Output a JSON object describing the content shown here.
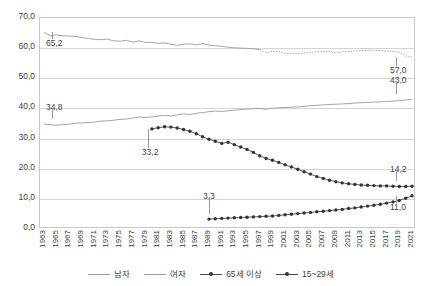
{
  "chart_data": {
    "type": "line",
    "title": "",
    "xlabel": "",
    "ylabel": "",
    "ylim": [
      0.0,
      70.0
    ],
    "ytick_labels": [
      "70,0",
      "60,0",
      "50,0",
      "40,0",
      "30,0",
      "20,0",
      "10,0",
      "0,0"
    ],
    "ytick_values": [
      70.0,
      60.0,
      50.0,
      40.0,
      30.0,
      20.0,
      10.0,
      0.0
    ],
    "grid": true,
    "legend_position": "bottom",
    "x": [
      1963,
      1964,
      1965,
      1966,
      1967,
      1968,
      1969,
      1970,
      1971,
      1972,
      1973,
      1974,
      1975,
      1976,
      1977,
      1978,
      1979,
      1980,
      1981,
      1982,
      1983,
      1984,
      1985,
      1986,
      1987,
      1988,
      1989,
      1990,
      1991,
      1992,
      1993,
      1994,
      1995,
      1996,
      1997,
      1998,
      1999,
      2000,
      2001,
      2002,
      2003,
      2004,
      2005,
      2006,
      2007,
      2008,
      2009,
      2010,
      2011,
      2012,
      2013,
      2014,
      2015,
      2016,
      2017,
      2018,
      2019,
      2020,
      2021
    ],
    "xtick_labels": [
      "1963",
      "1965",
      "1967",
      "1969",
      "1971",
      "1973",
      "1975",
      "1977",
      "1979",
      "1981",
      "1983",
      "1985",
      "1987",
      "1989",
      "1991",
      "1993",
      "1995",
      "1997",
      "1999",
      "2001",
      "2003",
      "2005",
      "2007",
      "2009",
      "2011",
      "2013",
      "2015",
      "2017",
      "2019",
      "2021"
    ],
    "series": [
      {
        "name": "남자",
        "style": "line-solid-then-dotted",
        "color": "#9a9a9a",
        "values": [
          65.2,
          64.2,
          64.4,
          64.1,
          64.0,
          63.9,
          63.5,
          63.2,
          62.9,
          62.8,
          63.0,
          62.4,
          62.3,
          62.6,
          62.0,
          62.4,
          61.9,
          61.9,
          61.6,
          61.7,
          61.3,
          60.9,
          61.3,
          61.4,
          61.1,
          61.5,
          61.0,
          60.8,
          60.6,
          60.3,
          60.1,
          60.0,
          59.9,
          59.8,
          59.5,
          58.6,
          58.9,
          58.8,
          58.3,
          58.3,
          58.2,
          58.4,
          58.6,
          58.8,
          59.0,
          58.9,
          58.3,
          58.8,
          58.9,
          59.1,
          59.2,
          59.3,
          59.3,
          59.2,
          59.0,
          58.9,
          58.7,
          57.4,
          57.0
        ],
        "label_points": [
          {
            "x": 1963,
            "value": "65,2"
          },
          {
            "x": 2021,
            "value": "57,0"
          }
        ]
      },
      {
        "name": "여자",
        "style": "line-solid",
        "color": "#9a9a9a",
        "values": [
          34.8,
          34.6,
          34.4,
          34.6,
          34.8,
          35.1,
          35.2,
          35.3,
          35.5,
          35.8,
          35.9,
          36.1,
          36.4,
          36.5,
          36.8,
          37.2,
          37.0,
          37.2,
          37.5,
          37.7,
          37.5,
          37.9,
          38.2,
          38.0,
          38.4,
          38.6,
          38.9,
          39.1,
          39.0,
          39.2,
          39.4,
          39.6,
          39.8,
          39.9,
          40.0,
          39.7,
          40.1,
          40.2,
          40.3,
          40.4,
          40.5,
          40.7,
          40.9,
          41.0,
          41.2,
          41.3,
          41.4,
          41.5,
          41.6,
          41.8,
          41.9,
          42.0,
          42.1,
          42.2,
          42.3,
          42.4,
          42.6,
          42.8,
          43.0
        ],
        "label_points": [
          {
            "x": 1963,
            "value": "34,8"
          },
          {
            "x": 2021,
            "value": "43,0"
          }
        ]
      },
      {
        "name": "65세 이상",
        "style": "line-marker",
        "color": "#4a4a4a",
        "start_year": 1989,
        "values_from_start": [
          3.3,
          3.4,
          3.5,
          3.6,
          3.7,
          3.8,
          3.9,
          4.0,
          4.1,
          4.2,
          4.3,
          4.5,
          4.7,
          4.9,
          5.1,
          5.3,
          5.5,
          5.7,
          5.9,
          6.1,
          6.3,
          6.5,
          6.8,
          7.0,
          7.3,
          7.6,
          7.9,
          8.2,
          8.6,
          9.0,
          9.5,
          10.2,
          11.0
        ],
        "label_points": [
          {
            "x": 1989,
            "value": "3,3"
          },
          {
            "x": 2021,
            "value": "11,0"
          }
        ]
      },
      {
        "name": "15~29세",
        "style": "line-marker",
        "color": "#4a4a4a",
        "start_year": 1980,
        "values_from_start": [
          33.2,
          33.6,
          33.9,
          33.8,
          33.5,
          33.0,
          32.4,
          31.6,
          30.6,
          29.8,
          29.1,
          28.4,
          28.8,
          28.0,
          27.2,
          26.4,
          25.4,
          24.3,
          23.4,
          22.8,
          22.1,
          21.3,
          20.6,
          19.8,
          19.0,
          18.2,
          17.4,
          16.8,
          16.2,
          15.7,
          15.3,
          15.0,
          14.8,
          14.6,
          14.5,
          14.4,
          14.3,
          14.3,
          14.2,
          14.1,
          14.1,
          14.2
        ],
        "label_points": [
          {
            "x": 1980,
            "value": "33,2"
          },
          {
            "x": 2021,
            "value": "14,2"
          }
        ]
      }
    ],
    "annotations": [
      {
        "text": "65,2",
        "series": "남자",
        "x": 1963,
        "value": 65.2
      },
      {
        "text": "34,8",
        "series": "여자",
        "x": 1963,
        "value": 34.8
      },
      {
        "text": "33,2",
        "series": "15~29세",
        "x": 1980,
        "value": 33.2
      },
      {
        "text": "3,3",
        "series": "65세 이상",
        "x": 1989,
        "value": 3.3
      },
      {
        "text": "57,0",
        "series": "남자",
        "x": 2021,
        "value": 57.0
      },
      {
        "text": "43,0",
        "series": "여자",
        "x": 2021,
        "value": 43.0
      },
      {
        "text": "14,2",
        "series": "15~29세",
        "x": 2021,
        "value": 14.2
      },
      {
        "text": "11,0",
        "series": "65세 이상",
        "x": 2021,
        "value": 11.0
      }
    ]
  },
  "legend": {
    "items": [
      {
        "label": "남자"
      },
      {
        "label": "여자"
      },
      {
        "label": "65세 이상"
      },
      {
        "label": "15~29세"
      }
    ]
  },
  "labels": {
    "l_65_2": "65,2",
    "l_34_8": "34,8",
    "l_33_2": "33,2",
    "l_3_3": "3,3",
    "l_57_0": "57,0",
    "l_43_0": "43,0",
    "l_14_2": "14,2",
    "l_11_0": "11,0"
  },
  "axis": {
    "y_labels": [
      "70,0",
      "60,0",
      "50,0",
      "40,0",
      "30,0",
      "20,0",
      "10,0",
      "0,0"
    ]
  }
}
